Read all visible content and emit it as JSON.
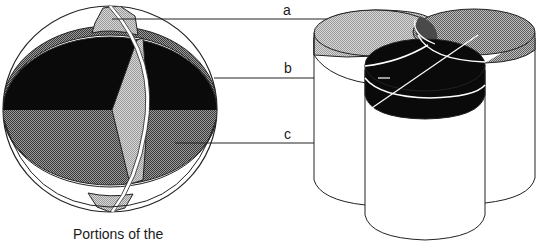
{
  "diagram": {
    "labels": [
      {
        "id": "a",
        "text": "a"
      },
      {
        "id": "b",
        "text": "b"
      },
      {
        "id": "c",
        "text": "c"
      }
    ],
    "caption": "Portions of the",
    "colors": {
      "black": "#0a0a0a",
      "dark_gray": "#6e6e6e",
      "medium_gray": "#8c8c8c",
      "light_gray": "#bcbcbc",
      "outline": "#222222",
      "white": "#ffffff"
    },
    "left_figure": "sphere-with-intersecting-regions",
    "right_figure": "three-overlapping-cylinders"
  }
}
